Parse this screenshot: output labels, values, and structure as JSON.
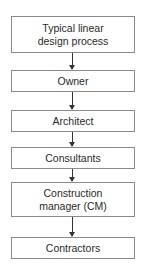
{
  "diagram": {
    "steps": [
      {
        "line1": "Typical linear",
        "line2": "design process"
      },
      {
        "line1": "Owner",
        "line2": ""
      },
      {
        "line1": "Architect",
        "line2": ""
      },
      {
        "line1": "Consultants",
        "line2": ""
      },
      {
        "line1": "Construction",
        "line2": "manager (CM)"
      },
      {
        "line1": "Contractors",
        "line2": ""
      }
    ]
  }
}
